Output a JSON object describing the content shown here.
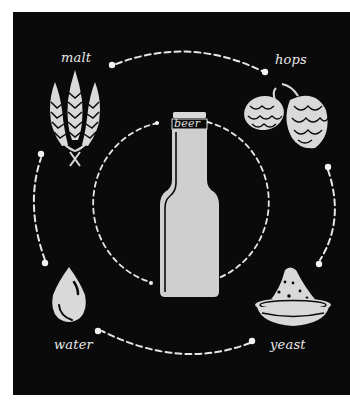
{
  "center": {
    "label": "beer",
    "icon": "beer-bottle-icon"
  },
  "ingredients": [
    {
      "label": "malt",
      "icon": "wheat-icon"
    },
    {
      "label": "hops",
      "icon": "hop-cones-icon"
    },
    {
      "label": "water",
      "icon": "water-drop-icon"
    },
    {
      "label": "yeast",
      "icon": "yeast-bowl-icon"
    }
  ],
  "colors": {
    "background": "#0a0a0a",
    "foreground": "#d9d9d9",
    "outline": "#0a0a0a",
    "page": "#ffffff"
  }
}
